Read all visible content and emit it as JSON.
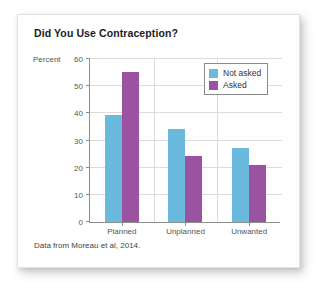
{
  "card": {
    "title": "Did You Use Contraception?",
    "source_note": "Data from Moreau et al, 2014."
  },
  "chart_data": {
    "type": "bar",
    "title": "Did You Use Contraception?",
    "xlabel": "",
    "ylabel": "Percent",
    "ylim": [
      0,
      60
    ],
    "yticks": [
      0,
      10,
      20,
      30,
      40,
      50,
      60
    ],
    "grid": true,
    "legend_position": "top-right",
    "categories": [
      "Planned",
      "Unplanned",
      "Unwanted"
    ],
    "series": [
      {
        "name": "Not asked",
        "color": "#6cb9de",
        "values": [
          39,
          34,
          27
        ]
      },
      {
        "name": "Asked",
        "color": "#9b52a0",
        "values": [
          55,
          24,
          21
        ]
      }
    ],
    "source": "Data from Moreau et al, 2014."
  }
}
